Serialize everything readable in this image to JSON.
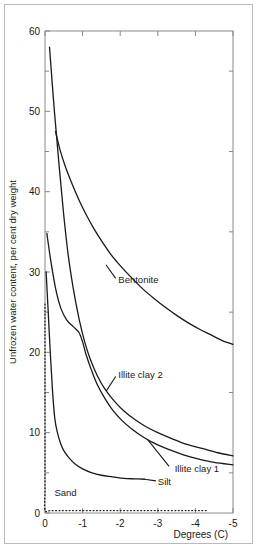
{
  "chart_data": {
    "type": "line",
    "title": "",
    "xlabel": "Degrees (C)",
    "ylabel": "Unfrozen water content, per cent dry weight",
    "xlim": [
      0,
      -5
    ],
    "ylim": [
      0,
      60
    ],
    "x_ticks": [
      "0",
      "-1",
      "-2",
      "-3",
      "-4",
      "-5"
    ],
    "x_tick_values": [
      0,
      -1,
      -2,
      -3,
      -4,
      -5
    ],
    "y_ticks": [
      "0",
      "10",
      "20",
      "30",
      "40",
      "50",
      "60"
    ],
    "y_tick_values": [
      0,
      10,
      20,
      30,
      40,
      50,
      60
    ],
    "y_minor_ticks": [
      5,
      15,
      25,
      35,
      45,
      55
    ],
    "grid": false,
    "legend": "inline-annotations",
    "series": [
      {
        "name": "Bentonite",
        "style": "solid",
        "label_x": -1.95,
        "label_y": 28.6,
        "points": [
          [
            -0.28,
            47.5
          ],
          [
            -0.4,
            45.2
          ],
          [
            -0.55,
            43.0
          ],
          [
            -0.7,
            41.2
          ],
          [
            -0.9,
            39.0
          ],
          [
            -1.1,
            37.1
          ],
          [
            -1.3,
            35.4
          ],
          [
            -1.5,
            33.9
          ],
          [
            -1.75,
            32.2
          ],
          [
            -2.0,
            30.8
          ],
          [
            -2.3,
            29.3
          ],
          [
            -2.6,
            27.9
          ],
          [
            -2.9,
            26.7
          ],
          [
            -3.2,
            25.6
          ],
          [
            -3.5,
            24.6
          ],
          [
            -3.8,
            23.7
          ],
          [
            -4.1,
            22.9
          ],
          [
            -4.4,
            22.2
          ],
          [
            -4.7,
            21.5
          ],
          [
            -5.0,
            21.0
          ]
        ]
      },
      {
        "name": "Illite clay 2",
        "style": "solid",
        "label_x": -1.95,
        "label_y": 16.8,
        "points": [
          [
            -0.12,
            58.0
          ],
          [
            -0.25,
            50.0
          ],
          [
            -0.38,
            43.0
          ],
          [
            -0.5,
            37.0
          ],
          [
            -0.62,
            32.0
          ],
          [
            -0.75,
            28.0
          ],
          [
            -0.9,
            24.3
          ],
          [
            -1.05,
            21.4
          ],
          [
            -1.2,
            19.2
          ],
          [
            -1.4,
            17.0
          ],
          [
            -1.6,
            15.4
          ],
          [
            -1.85,
            13.9
          ],
          [
            -2.1,
            12.7
          ],
          [
            -2.4,
            11.6
          ],
          [
            -2.7,
            10.7
          ],
          [
            -3.0,
            10.0
          ],
          [
            -3.4,
            9.2
          ],
          [
            -3.8,
            8.5
          ],
          [
            -4.2,
            8.0
          ],
          [
            -4.6,
            7.5
          ],
          [
            -5.0,
            7.1
          ]
        ]
      },
      {
        "name": "Illite clay 1",
        "style": "solid",
        "label_x": -3.45,
        "label_y": 5.1,
        "points": [
          [
            -0.05,
            34.8
          ],
          [
            -0.15,
            31.5
          ],
          [
            -0.28,
            28.0
          ],
          [
            -0.42,
            25.5
          ],
          [
            -0.58,
            24.0
          ],
          [
            -0.75,
            23.2
          ],
          [
            -0.9,
            22.5
          ],
          [
            -1.0,
            21.3
          ],
          [
            -1.1,
            19.6
          ],
          [
            -1.25,
            17.6
          ],
          [
            -1.4,
            15.9
          ],
          [
            -1.6,
            14.2
          ],
          [
            -1.8,
            12.8
          ],
          [
            -2.05,
            11.5
          ],
          [
            -2.3,
            10.5
          ],
          [
            -2.6,
            9.5
          ],
          [
            -2.9,
            8.7
          ],
          [
            -3.3,
            7.9
          ],
          [
            -3.7,
            7.2
          ],
          [
            -4.1,
            6.7
          ],
          [
            -4.5,
            6.3
          ],
          [
            -5.0,
            6.0
          ]
        ]
      },
      {
        "name": "Silt",
        "style": "solid",
        "label_x": -3.0,
        "label_y": 3.5,
        "points": [
          [
            -0.03,
            30.0
          ],
          [
            -0.08,
            25.5
          ],
          [
            -0.14,
            20.0
          ],
          [
            -0.2,
            15.2
          ],
          [
            -0.26,
            11.8
          ],
          [
            -0.33,
            10.0
          ],
          [
            -0.42,
            8.6
          ],
          [
            -0.52,
            7.6
          ],
          [
            -0.65,
            6.8
          ],
          [
            -0.8,
            6.1
          ],
          [
            -1.0,
            5.5
          ],
          [
            -1.25,
            5.0
          ],
          [
            -1.5,
            4.7
          ],
          [
            -1.8,
            4.5
          ],
          [
            -2.1,
            4.3
          ],
          [
            -2.4,
            4.25
          ],
          [
            -2.65,
            4.2
          ]
        ]
      },
      {
        "name": "Sand",
        "style": "dotted",
        "label_x": -0.25,
        "label_y": 2.1,
        "points": [
          [
            0.0,
            26.0
          ],
          [
            0.0,
            20.0
          ],
          [
            0.0,
            14.0
          ],
          [
            0.0,
            8.0
          ],
          [
            0.0,
            3.0
          ],
          [
            0.0,
            0.4
          ],
          [
            -0.15,
            0.3
          ],
          [
            -0.6,
            0.3
          ],
          [
            -1.2,
            0.3
          ],
          [
            -1.8,
            0.3
          ],
          [
            -2.4,
            0.3
          ],
          [
            -3.0,
            0.3
          ],
          [
            -3.6,
            0.3
          ],
          [
            -4.0,
            0.3
          ],
          [
            -4.35,
            0.3
          ]
        ]
      }
    ],
    "leader_lines": [
      {
        "name": "bentonite-leader",
        "from_x": -1.62,
        "from_y": 30.9,
        "to_x": -1.88,
        "to_y": 29.2
      },
      {
        "name": "illite2-leader",
        "from_x": -1.63,
        "from_y": 15.2,
        "to_x": -1.88,
        "to_y": 17.0
      },
      {
        "name": "illite1-leader",
        "from_x": -2.72,
        "from_y": 9.2,
        "to_x": -3.3,
        "to_y": 5.8
      },
      {
        "name": "silt-leader",
        "from_x": -2.65,
        "from_y": 4.2,
        "to_x": -2.95,
        "to_y": 4.0
      }
    ]
  },
  "plot_geometry": {
    "left": 45,
    "right": 233,
    "top": 31,
    "bottom": 513
  },
  "colors": {
    "curve": "#1a1a1a",
    "axis": "#888888",
    "frame": "#8a8a8a",
    "outer_border": "#b9b9b9",
    "text": "#1a1a1a",
    "background": "#ffffff"
  }
}
